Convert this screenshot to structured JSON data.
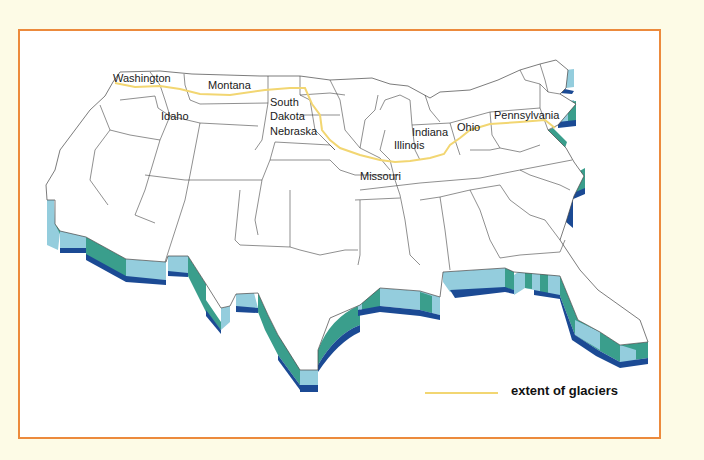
{
  "map": {
    "title": "",
    "state_labels": [
      {
        "name": "Washington",
        "x": 113,
        "y": 82
      },
      {
        "name": "Montana",
        "x": 208,
        "y": 89
      },
      {
        "name": "Idaho",
        "x": 161,
        "y": 120
      },
      {
        "name": "South",
        "x": 270,
        "y": 106
      },
      {
        "name": "Dakota",
        "x": 270,
        "y": 120
      },
      {
        "name": "Nebraska",
        "x": 270,
        "y": 135
      },
      {
        "name": "Illinois",
        "x": 394,
        "y": 149
      },
      {
        "name": "Indiana",
        "x": 412,
        "y": 136
      },
      {
        "name": "Ohio",
        "x": 457,
        "y": 131
      },
      {
        "name": "Pennsylvania",
        "x": 494,
        "y": 119
      },
      {
        "name": "Missouri",
        "x": 360,
        "y": 180
      }
    ],
    "colors": {
      "frame": "#ec8a3c",
      "background": "#fdfbe6",
      "glacier_line": "#f2d672",
      "coast_light": "#94cddd",
      "coast_teal": "#3a9e8c",
      "coast_dark": "#1b4a94"
    }
  },
  "legend": {
    "label": "extent of glaciers",
    "line_color": "#f2d672"
  }
}
